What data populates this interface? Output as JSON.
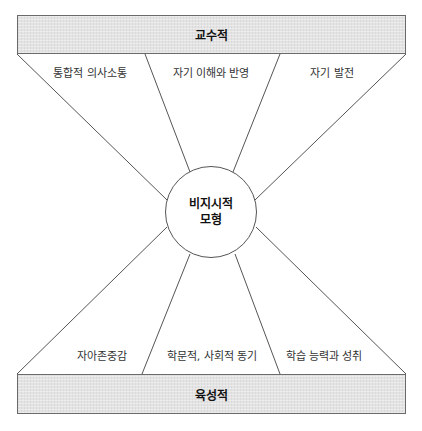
{
  "diagram": {
    "top_band": {
      "label": "교수적"
    },
    "bottom_band": {
      "label": "육성적"
    },
    "center": {
      "line1": "비지시적",
      "line2": "모형"
    },
    "top_segments": [
      {
        "label": "통합적 의사소통"
      },
      {
        "label": "자기 이해와 반영"
      },
      {
        "label": "자기 발전"
      }
    ],
    "bottom_segments": [
      {
        "label": "자아존중감"
      },
      {
        "label": "학문적, 사회적 동기"
      },
      {
        "label": "학습 능력과 성취"
      }
    ],
    "colors": {
      "band_fill": "#e3e3e3",
      "line": "#555555",
      "text": "#222222"
    }
  }
}
